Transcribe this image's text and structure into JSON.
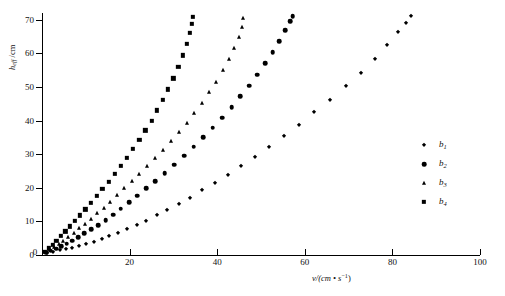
{
  "chart_data": {
    "type": "scatter",
    "title": "",
    "xlabel": "v/(cm · s⁻¹)",
    "ylabel": "h_eff /cm",
    "xlim": [
      0,
      100
    ],
    "ylim": [
      0,
      72
    ],
    "grid": false,
    "legend_position": "right",
    "xticks": [
      "0",
      "20",
      "40",
      "60",
      "80",
      "100"
    ],
    "xtick_values": [
      0,
      20,
      40,
      60,
      80,
      100
    ],
    "yticks": [
      "0",
      "10",
      "20",
      "30",
      "40",
      "50",
      "60",
      "70"
    ],
    "ytick_values": [
      0,
      10,
      20,
      30,
      40,
      50,
      60,
      70
    ],
    "series": [
      {
        "name": "b1",
        "marker": "diamond",
        "points": [
          [
            1.2,
            0.6
          ],
          [
            2.6,
            1.0
          ],
          [
            4.0,
            1.4
          ],
          [
            5.4,
            1.8
          ],
          [
            6.8,
            2.2
          ],
          [
            8.4,
            2.8
          ],
          [
            10.0,
            3.4
          ],
          [
            11.8,
            4.0
          ],
          [
            13.6,
            4.8
          ],
          [
            15.4,
            5.6
          ],
          [
            17.4,
            6.6
          ],
          [
            19.4,
            7.6
          ],
          [
            21.6,
            8.8
          ],
          [
            23.8,
            10.2
          ],
          [
            26.2,
            11.8
          ],
          [
            28.6,
            13.4
          ],
          [
            31.2,
            15.2
          ],
          [
            33.8,
            17.0
          ],
          [
            36.6,
            19.2
          ],
          [
            39.4,
            21.4
          ],
          [
            42.4,
            23.8
          ],
          [
            45.4,
            26.4
          ],
          [
            48.6,
            29.2
          ],
          [
            51.8,
            32.2
          ],
          [
            55.2,
            35.4
          ],
          [
            58.6,
            38.8
          ],
          [
            62.2,
            42.4
          ],
          [
            65.8,
            46.2
          ],
          [
            69.4,
            50.2
          ],
          [
            72.8,
            54.2
          ],
          [
            76.0,
            58.4
          ],
          [
            78.8,
            62.4
          ],
          [
            81.2,
            66.2
          ],
          [
            83.0,
            69.0
          ],
          [
            84.2,
            71.0
          ]
        ]
      },
      {
        "name": "b2",
        "marker": "circle",
        "points": [
          [
            0.9,
            0.7
          ],
          [
            2.0,
            1.3
          ],
          [
            3.2,
            1.9
          ],
          [
            4.4,
            2.6
          ],
          [
            5.6,
            3.4
          ],
          [
            6.9,
            4.3
          ],
          [
            8.3,
            5.3
          ],
          [
            9.7,
            6.4
          ],
          [
            11.2,
            7.6
          ],
          [
            12.8,
            8.9
          ],
          [
            14.5,
            10.4
          ],
          [
            16.2,
            12.0
          ],
          [
            18.0,
            13.8
          ],
          [
            19.9,
            15.7
          ],
          [
            21.8,
            17.7
          ],
          [
            23.8,
            19.8
          ],
          [
            25.9,
            22.0
          ],
          [
            28.0,
            24.4
          ],
          [
            30.2,
            26.9
          ],
          [
            32.4,
            29.5
          ],
          [
            34.6,
            32.2
          ],
          [
            36.8,
            35.0
          ],
          [
            39.0,
            37.9
          ],
          [
            41.2,
            40.9
          ],
          [
            43.3,
            44.0
          ],
          [
            45.3,
            47.2
          ],
          [
            47.3,
            50.4
          ],
          [
            49.2,
            53.7
          ],
          [
            51.0,
            57.0
          ],
          [
            52.7,
            60.3
          ],
          [
            54.2,
            63.6
          ],
          [
            55.5,
            66.8
          ],
          [
            56.6,
            69.6
          ],
          [
            57.2,
            71.0
          ]
        ]
      },
      {
        "name": "b3",
        "marker": "triangle",
        "points": [
          [
            0.8,
            0.8
          ],
          [
            1.8,
            1.6
          ],
          [
            2.8,
            2.4
          ],
          [
            3.8,
            3.3
          ],
          [
            4.9,
            4.3
          ],
          [
            6.0,
            5.4
          ],
          [
            7.2,
            6.6
          ],
          [
            8.5,
            7.9
          ],
          [
            9.8,
            9.3
          ],
          [
            11.2,
            10.8
          ],
          [
            12.6,
            12.4
          ],
          [
            14.1,
            14.1
          ],
          [
            15.6,
            15.9
          ],
          [
            17.2,
            17.8
          ],
          [
            18.8,
            19.8
          ],
          [
            20.5,
            21.9
          ],
          [
            22.2,
            24.1
          ],
          [
            24.0,
            26.4
          ],
          [
            25.8,
            28.8
          ],
          [
            27.6,
            31.3
          ],
          [
            29.4,
            33.9
          ],
          [
            31.2,
            36.6
          ],
          [
            33.0,
            39.4
          ],
          [
            34.8,
            42.3
          ],
          [
            36.5,
            45.3
          ],
          [
            38.2,
            48.4
          ],
          [
            39.8,
            51.6
          ],
          [
            41.3,
            54.9
          ],
          [
            42.7,
            58.2
          ],
          [
            43.9,
            61.5
          ],
          [
            44.9,
            64.8
          ],
          [
            45.6,
            67.9
          ],
          [
            46.0,
            70.4
          ]
        ]
      },
      {
        "name": "b4",
        "marker": "square",
        "points": [
          [
            0.7,
            1.0
          ],
          [
            1.5,
            2.0
          ],
          [
            2.4,
            3.1
          ],
          [
            3.3,
            4.3
          ],
          [
            4.3,
            5.6
          ],
          [
            5.3,
            7.0
          ],
          [
            6.4,
            8.5
          ],
          [
            7.5,
            10.1
          ],
          [
            8.7,
            11.8
          ],
          [
            9.9,
            13.6
          ],
          [
            11.2,
            15.5
          ],
          [
            12.5,
            17.5
          ],
          [
            13.8,
            19.6
          ],
          [
            15.2,
            21.8
          ],
          [
            16.6,
            24.1
          ],
          [
            18.0,
            26.5
          ],
          [
            19.4,
            29.0
          ],
          [
            20.8,
            31.6
          ],
          [
            22.2,
            34.3
          ],
          [
            23.6,
            37.1
          ],
          [
            25.0,
            40.0
          ],
          [
            26.3,
            43.0
          ],
          [
            27.6,
            46.1
          ],
          [
            28.8,
            49.3
          ],
          [
            30.0,
            52.6
          ],
          [
            31.1,
            56.0
          ],
          [
            32.1,
            59.4
          ],
          [
            33.0,
            62.8
          ],
          [
            33.7,
            66.0
          ],
          [
            34.2,
            68.8
          ],
          [
            34.5,
            70.8
          ]
        ]
      }
    ]
  },
  "legend": {
    "entries": [
      {
        "label": "b1",
        "base": "b",
        "sub": "1",
        "marker": "diamond"
      },
      {
        "label": "b2",
        "base": "b",
        "sub": "2",
        "marker": "circle"
      },
      {
        "label": "b3",
        "base": "b",
        "sub": "3",
        "marker": "triangle"
      },
      {
        "label": "b4",
        "base": "b",
        "sub": "4",
        "marker": "square"
      }
    ]
  },
  "axis_titles": {
    "y_base": "h",
    "y_sub": "eff",
    "y_unit": " /cm",
    "x_text": "v/(cm • s",
    "x_sup": "−1",
    "x_tail": ")"
  }
}
